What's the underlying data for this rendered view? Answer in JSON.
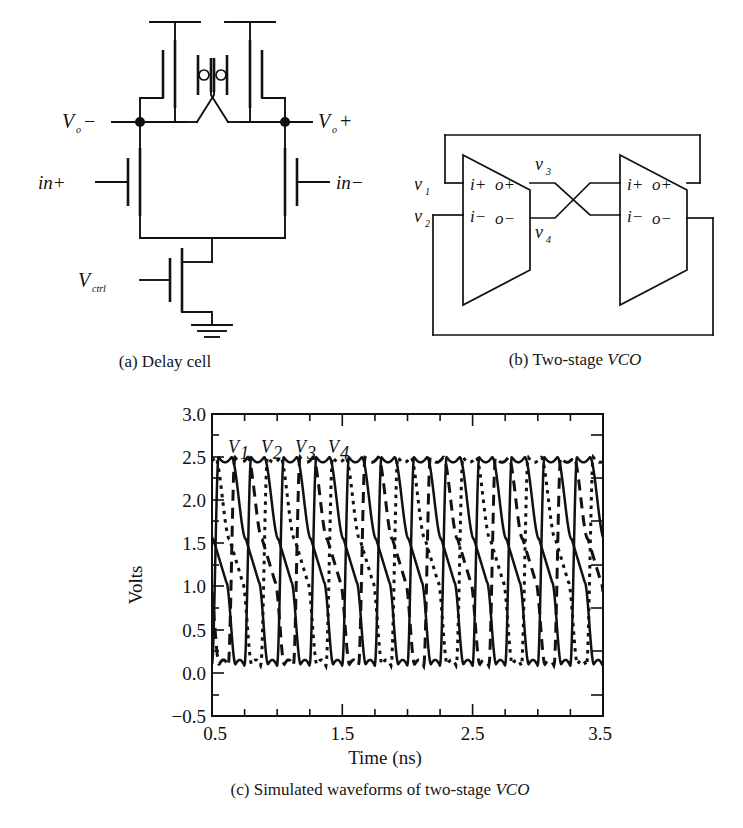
{
  "figure": {
    "panels": [
      {
        "id": "a",
        "caption": "(a) Delay cell",
        "type": "schematic",
        "labels": {
          "out_neg": "V",
          "out_neg_sub": "o",
          "out_neg_sign": "−",
          "out_pos": "V",
          "out_pos_sub": "o",
          "out_pos_sign": "+",
          "in_pos": "in+",
          "in_neg": "in−",
          "ctrl": "V",
          "ctrl_sub": "ctrl"
        }
      },
      {
        "id": "b",
        "caption": "(b) Two-stage VCO",
        "caption_plain": "(b) Two-stage ",
        "caption_italic": "VCO",
        "type": "block-diagram",
        "labels": {
          "v1": "v",
          "v1_sub": "1",
          "v2": "v",
          "v2_sub": "2",
          "v3": "v",
          "v3_sub": "3",
          "v4": "v",
          "v4_sub": "4",
          "port_ip": "i+",
          "port_op": "o+",
          "port_in": "i−",
          "port_on": "o−"
        }
      },
      {
        "id": "c",
        "caption_plain": "(c) Simulated waveforms of two-stage ",
        "caption_italic": "VCO",
        "caption": "(c) Simulated waveforms of two-stage VCO",
        "type": "chart"
      }
    ]
  },
  "chart_data": {
    "type": "line",
    "title": "",
    "xlabel": "Time (ns)",
    "ylabel": "Volts",
    "xlim": [
      0.5,
      3.5
    ],
    "ylim": [
      -0.5,
      3.0
    ],
    "xticks": [
      0.5,
      1.5,
      2.5,
      3.5
    ],
    "xticklabels": [
      "0.5",
      "1.5",
      "2.5",
      "3.5"
    ],
    "xminorticks": [
      0.75,
      1.0,
      1.25,
      1.75,
      2.0,
      2.25,
      2.75,
      3.0,
      3.25
    ],
    "yticks": [
      -0.5,
      0.0,
      0.5,
      1.0,
      1.5,
      2.0,
      2.5,
      3.0
    ],
    "yticklabels": [
      "−0.5",
      "0.0",
      "0.5",
      "1.0",
      "1.5",
      "2.0",
      "2.5",
      "3.0"
    ],
    "yminorticks": [
      -0.25,
      0.25,
      0.75,
      1.25,
      1.75,
      2.25,
      2.75
    ],
    "grid": false,
    "legend_position": "inline-top",
    "annotations": [
      {
        "text": "V",
        "sub": "1",
        "x": 0.62,
        "y": 2.78
      },
      {
        "text": "V",
        "sub": "2",
        "x": 0.87,
        "y": 2.78
      },
      {
        "text": "V",
        "sub": "3",
        "x": 1.13,
        "y": 2.78
      },
      {
        "text": "V",
        "sub": "4",
        "x": 1.37,
        "y": 2.78
      }
    ],
    "period_ns": 0.5,
    "vhigh": 2.5,
    "vlow": 0.1,
    "series": [
      {
        "name": "V1",
        "style": "solid",
        "phase_ns": 0.0,
        "color": "#111111"
      },
      {
        "name": "V2",
        "style": "dashed",
        "phase_ns": 0.125,
        "color": "#111111"
      },
      {
        "name": "V3",
        "style": "solid",
        "phase_ns": 0.25,
        "color": "#111111"
      },
      {
        "name": "V4",
        "style": "dotted",
        "phase_ns": 0.375,
        "color": "#111111"
      }
    ]
  }
}
